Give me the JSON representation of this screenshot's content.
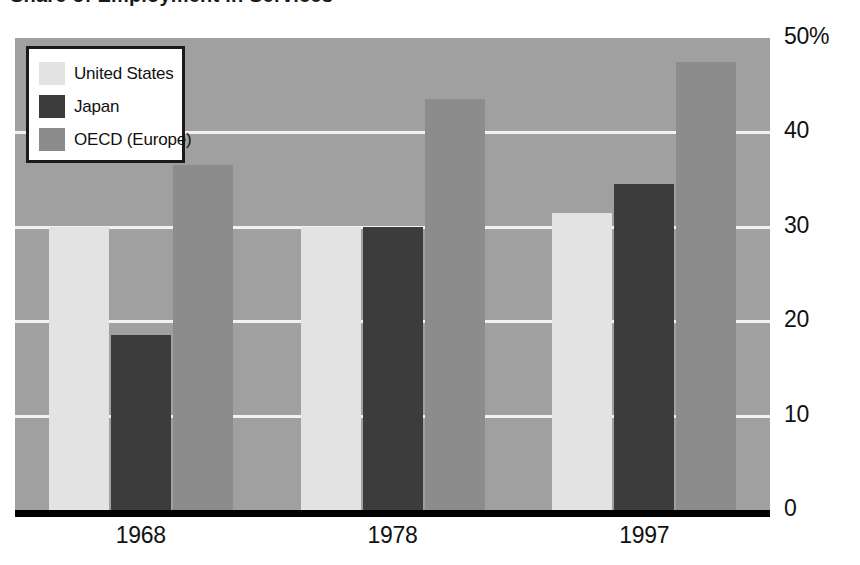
{
  "title": "Share of Employment in Services",
  "chart_data": {
    "type": "bar",
    "title": "Share of Employment in Services",
    "xlabel": "",
    "ylabel": "",
    "categories": [
      "1968",
      "1978",
      "1997"
    ],
    "series": [
      {
        "name": "United States",
        "color": "#e3e3e3",
        "values": [
          30.0,
          30.0,
          31.5
        ]
      },
      {
        "name": "Japan",
        "color": "#3c3c3c",
        "values": [
          18.5,
          30.0,
          34.5
        ]
      },
      {
        "name": "OECD (Europe)",
        "color": "#8c8c8c",
        "values": [
          36.5,
          43.5,
          47.5
        ]
      }
    ],
    "ylim": [
      0,
      50
    ],
    "yticks": [
      0,
      10,
      20,
      30,
      40,
      50
    ],
    "ytick_labels": [
      "0",
      "10",
      "20",
      "30",
      "40",
      "50%"
    ],
    "grid": true,
    "gridlines_at": [
      10,
      20,
      30,
      40
    ],
    "legend_position": "top-left",
    "plot_background": "#a0a0a0",
    "gridline_color": "#f2f2f2",
    "axis_color": "#000000"
  },
  "axis": {
    "y_labels": [
      {
        "text": "50%",
        "value": 50
      },
      {
        "text": "40",
        "value": 40
      },
      {
        "text": "30",
        "value": 30
      },
      {
        "text": "20",
        "value": 20
      },
      {
        "text": "10",
        "value": 10
      },
      {
        "text": "0",
        "value": 0
      }
    ],
    "x_labels": [
      "1968",
      "1978",
      "1997"
    ]
  },
  "legend": {
    "items": [
      {
        "label": "United States",
        "swatch": "us"
      },
      {
        "label": "Japan",
        "swatch": "jp"
      },
      {
        "label": "OECD (Europe)",
        "swatch": "oecd"
      }
    ]
  }
}
